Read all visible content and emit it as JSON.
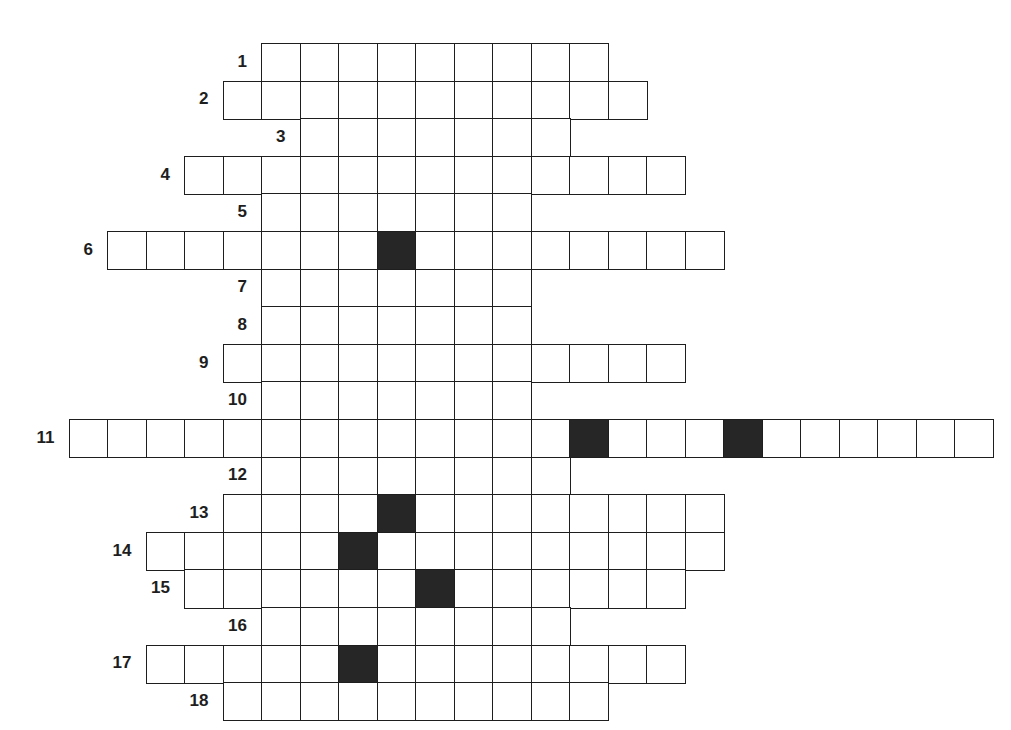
{
  "puzzle": {
    "type": "crossword-grid",
    "grid": {
      "origin_x": 68.5,
      "origin_y": 43,
      "cell_w": 38.5,
      "cell_h": 37.6,
      "columns": 24,
      "rows": 18
    },
    "colors": {
      "line": "#1e1e1e",
      "black_cell": "#262626",
      "background": "#ffffff"
    },
    "rows": [
      {
        "label": "1",
        "start": 5,
        "length": 9,
        "black": []
      },
      {
        "label": "2",
        "start": 4,
        "length": 11,
        "black": []
      },
      {
        "label": "3",
        "start": 6,
        "length": 7,
        "black": []
      },
      {
        "label": "4",
        "start": 3,
        "length": 13,
        "black": []
      },
      {
        "label": "5",
        "start": 5,
        "length": 7,
        "black": []
      },
      {
        "label": "6",
        "start": 1,
        "length": 16,
        "black": [
          8
        ]
      },
      {
        "label": "7",
        "start": 5,
        "length": 7,
        "black": []
      },
      {
        "label": "8",
        "start": 5,
        "length": 7,
        "black": []
      },
      {
        "label": "9",
        "start": 4,
        "length": 12,
        "black": []
      },
      {
        "label": "10",
        "start": 5,
        "length": 7,
        "black": []
      },
      {
        "label": "11",
        "start": 0,
        "length": 24,
        "black": [
          13,
          17
        ]
      },
      {
        "label": "12",
        "start": 5,
        "length": 8,
        "black": []
      },
      {
        "label": "13",
        "start": 4,
        "length": 13,
        "black": [
          8
        ]
      },
      {
        "label": "14",
        "start": 2,
        "length": 15,
        "black": [
          7
        ]
      },
      {
        "label": "15",
        "start": 3,
        "length": 13,
        "black": [
          9
        ]
      },
      {
        "label": "16",
        "start": 5,
        "length": 8,
        "black": []
      },
      {
        "label": "17",
        "start": 2,
        "length": 14,
        "black": [
          7
        ]
      },
      {
        "label": "18",
        "start": 4,
        "length": 10,
        "black": []
      }
    ]
  }
}
